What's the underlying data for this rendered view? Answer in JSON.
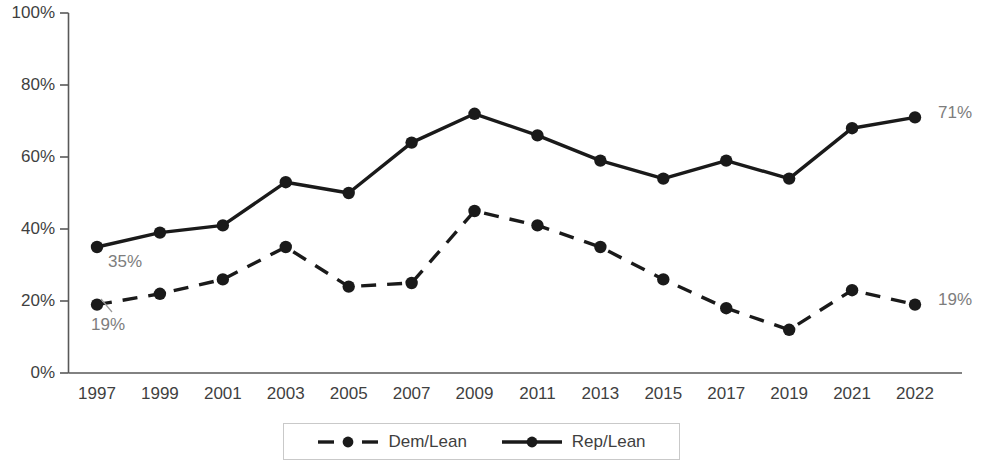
{
  "chart_data": {
    "type": "line",
    "title": "",
    "subtitle": "",
    "xlabel": "",
    "ylabel": "",
    "x": [
      "1997",
      "1999",
      "2001",
      "2003",
      "2005",
      "2007",
      "2009",
      "2011",
      "2013",
      "2015",
      "2017",
      "2019",
      "2021",
      "2022"
    ],
    "categories": [
      "1997",
      "1999",
      "2001",
      "2003",
      "2005",
      "2007",
      "2009",
      "2011",
      "2013",
      "2015",
      "2017",
      "2019",
      "2021",
      "2022"
    ],
    "series": [
      {
        "name": "Dem/Lean",
        "style": "dashed",
        "color": "#1a1a1a",
        "values": [
          19,
          22,
          26,
          35,
          24,
          25,
          45,
          41,
          35,
          26,
          18,
          12,
          23,
          19
        ]
      },
      {
        "name": "Rep/Lean",
        "style": "solid",
        "color": "#1a1a1a",
        "values": [
          35,
          39,
          41,
          53,
          50,
          64,
          72,
          66,
          59,
          54,
          59,
          54,
          68,
          71
        ]
      }
    ],
    "ylim": [
      0,
      100
    ],
    "ytick_labels": [
      "0%",
      "20%",
      "40%",
      "60%",
      "80%",
      "100%"
    ],
    "ytick_values": [
      0,
      20,
      40,
      60,
      80,
      100
    ],
    "grid": false,
    "legend_position": "bottom"
  },
  "axes": {
    "y_ticks": [
      {
        "label": "100%",
        "value": 100
      },
      {
        "label": "80%",
        "value": 80
      },
      {
        "label": "60%",
        "value": 60
      },
      {
        "label": "40%",
        "value": 40
      },
      {
        "label": "20%",
        "value": 20
      },
      {
        "label": "0%",
        "value": 0
      }
    ],
    "x_ticks": [
      {
        "label": "1997"
      },
      {
        "label": "1999"
      },
      {
        "label": "2001"
      },
      {
        "label": "2003"
      },
      {
        "label": "2005"
      },
      {
        "label": "2007"
      },
      {
        "label": "2009"
      },
      {
        "label": "2011"
      },
      {
        "label": "2013"
      },
      {
        "label": "2015"
      },
      {
        "label": "2017"
      },
      {
        "label": "2019"
      },
      {
        "label": "2021"
      },
      {
        "label": "2022"
      }
    ]
  },
  "annotations": [
    {
      "name": "rep-start-label",
      "text": "35%"
    },
    {
      "name": "dem-start-label",
      "text": "19%"
    },
    {
      "name": "rep-end-label",
      "text": "71%"
    },
    {
      "name": "dem-end-label",
      "text": "19%"
    }
  ],
  "legend": {
    "entries": [
      {
        "label": "Dem/Lean",
        "style": "dashed"
      },
      {
        "label": "Rep/Lean",
        "style": "solid"
      }
    ]
  },
  "colors": {
    "line": "#1a1a1a",
    "axis": "#595959",
    "tick_text": "#3f3f3f",
    "annotation_text": "#7d7d7d",
    "legend_border": "#c9c9c9",
    "background": "#ffffff"
  }
}
